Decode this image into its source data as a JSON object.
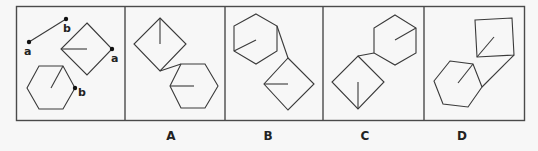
{
  "puzzle": {
    "given_panel": {
      "point_labels": {
        "segment_a": "a",
        "segment_b": "b",
        "square_a": "a",
        "hexagon_b": "b"
      }
    },
    "options": [
      {
        "id": "A",
        "label": "A"
      },
      {
        "id": "B",
        "label": "B"
      },
      {
        "id": "C",
        "label": "C"
      },
      {
        "id": "D",
        "label": "D"
      }
    ],
    "colors": {
      "line": "#3a3a3a",
      "frame": "#4a4a4a",
      "background": "#f7f7f7"
    }
  }
}
